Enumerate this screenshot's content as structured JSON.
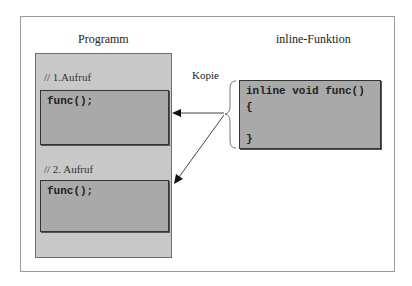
{
  "diagram": {
    "left_title": "Programm",
    "right_title": "inline-Funktion",
    "arrow_label": "Kopie",
    "calls": [
      {
        "comment": "// 1.Aufruf",
        "code": "func();"
      },
      {
        "comment": "// 2. Aufruf",
        "code": "func();"
      }
    ],
    "function": {
      "lines": [
        "inline void func()",
        "{",
        "",
        "}"
      ]
    },
    "colors": {
      "panel": "#c8c8c8",
      "codebox": "#a9a9a9",
      "frame_border": "#9a9a9a"
    }
  }
}
